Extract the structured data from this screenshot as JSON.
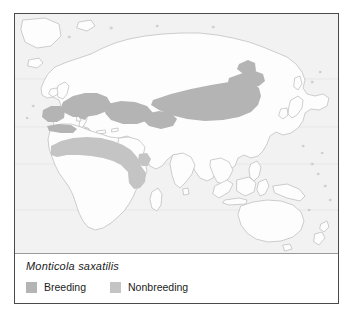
{
  "figure": {
    "type": "species-distribution-range-map",
    "border_color": "#4a4a4a"
  },
  "map": {
    "background_color": "#f2f2f2",
    "land_fill": "#fdfdfd",
    "coastline_color": "#b9b9b9",
    "graticule_color": "#e2e2e2",
    "projection_note": "Old World / Eastern Hemisphere"
  },
  "legend": {
    "species": "Monticola saxatilis",
    "entries": [
      {
        "label": "Breeding",
        "color": "#b4b4b4",
        "swatch_name": "breeding-swatch"
      },
      {
        "label": "Nonbreeding",
        "color": "#c4c4c4",
        "swatch_name": "nonbreeding-swatch"
      }
    ]
  },
  "ranges": {
    "breeding_color": "#b4b4b4",
    "nonbreeding_color": "#c4c4c4",
    "breeding_regions": [
      "Iberia",
      "North Africa",
      "Mediterranean",
      "Anatolia",
      "Caucasus",
      "Central Asia",
      "Mongolia",
      "Lake Baikal"
    ],
    "nonbreeding_regions": [
      "Sahel",
      "East Africa",
      "Horn of Africa"
    ]
  }
}
